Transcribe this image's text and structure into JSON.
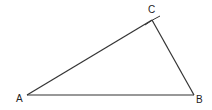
{
  "diagram": {
    "type": "triangle-construction",
    "stroke_color": "#333333",
    "vertices": [
      {
        "id": "A",
        "label": "A",
        "x": 27,
        "y": 95,
        "label_x": 16,
        "label_y": 102
      },
      {
        "id": "B",
        "label": "B",
        "x": 194,
        "y": 95,
        "label_x": 196,
        "label_y": 103
      },
      {
        "id": "C",
        "label": "C",
        "x": 152,
        "y": 20,
        "label_x": 148,
        "label_y": 13
      }
    ],
    "sides": [
      {
        "from": "A",
        "to": "B"
      },
      {
        "from": "B",
        "to": "C"
      },
      {
        "from": "A",
        "to": "C"
      }
    ],
    "construction_arc": {
      "x1": 145,
      "y1": 25,
      "x2": 160,
      "y2": 16
    }
  }
}
